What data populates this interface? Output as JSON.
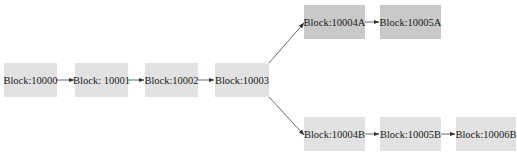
{
  "diagram": {
    "type": "blockchain-fork",
    "colors": {
      "block_light": "#e2e2e2",
      "block_dark": "#c9c9c9",
      "edge": "#333333",
      "background": "#ffffff"
    },
    "blocks": [
      {
        "id": "b10000",
        "label": "Block:10000",
        "row": "main"
      },
      {
        "id": "b10001",
        "label": "Block: 10001",
        "row": "main"
      },
      {
        "id": "b10002",
        "label": "Block:10002",
        "row": "main"
      },
      {
        "id": "b10003",
        "label": "Block:10003",
        "row": "main"
      },
      {
        "id": "b10004A",
        "label": "Block:10004A",
        "row": "fork-a",
        "shade": "dark"
      },
      {
        "id": "b10005A",
        "label": "Block:10005A",
        "row": "fork-a",
        "shade": "dark"
      },
      {
        "id": "b10004B",
        "label": "Block:10004B",
        "row": "fork-b"
      },
      {
        "id": "b10005B",
        "label": "Block:10005B",
        "row": "fork-b"
      },
      {
        "id": "b10006B",
        "label": "Block:10006B",
        "row": "fork-b"
      }
    ],
    "edges": [
      {
        "from": "b10000",
        "to": "b10001"
      },
      {
        "from": "b10001",
        "to": "b10002"
      },
      {
        "from": "b10002",
        "to": "b10003"
      },
      {
        "from": "b10003",
        "to": "b10004A"
      },
      {
        "from": "b10004A",
        "to": "b10005A"
      },
      {
        "from": "b10003",
        "to": "b10004B"
      },
      {
        "from": "b10004B",
        "to": "b10005B"
      },
      {
        "from": "b10005B",
        "to": "b10006B"
      }
    ]
  }
}
